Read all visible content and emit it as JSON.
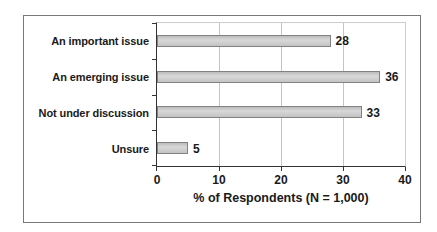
{
  "chart_data": {
    "type": "bar",
    "orientation": "horizontal",
    "title": "",
    "categories": [
      "An important issue",
      "An emerging issue",
      "Not under discussion",
      "Unsure"
    ],
    "values": [
      28,
      36,
      33,
      5
    ],
    "data_labels": [
      "28",
      "36",
      "33",
      "5"
    ],
    "xlabel": "% of Respondents (N = 1,000)",
    "ylabel": "",
    "x_ticks": [
      0,
      10,
      20,
      30,
      40
    ],
    "xlim": [
      0,
      40
    ],
    "grid": "vertical-major",
    "legend": "none",
    "colors": {
      "bar_fill": "#c9c9c9",
      "bar_border": "#828282",
      "grid_color": "#c4c4c4",
      "axis_color": "#333333",
      "plot_border": "#cccccc",
      "frame_border": "#787878",
      "text": "#1a1a1a",
      "background": "#ffffff"
    }
  }
}
